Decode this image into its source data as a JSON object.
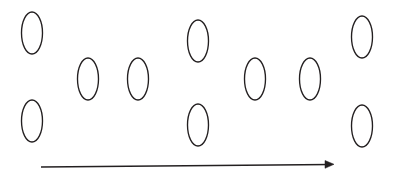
{
  "figure": {
    "background_color": "#ffffff",
    "stroke_color": "#231f20",
    "width": 396,
    "height": 175
  },
  "chart_data": {
    "type": "scatter",
    "title": "",
    "xlabel": "",
    "ylabel": "",
    "grid": false,
    "legend": "none",
    "xlim": [
      0,
      396
    ],
    "ylim": [
      0,
      175
    ],
    "marker": "open-ellipse",
    "note": "Ten open vertically-elongated ellipses in a staggered three-row arrangement above a left-to-right arrow",
    "series": [
      {
        "name": "top-row",
        "points": [
          {
            "x": 32,
            "y": 33
          },
          {
            "x": 198,
            "y": 41
          },
          {
            "x": 362,
            "y": 37
          }
        ]
      },
      {
        "name": "middle-row",
        "points": [
          {
            "x": 88,
            "y": 79
          },
          {
            "x": 138,
            "y": 79
          },
          {
            "x": 255,
            "y": 79
          },
          {
            "x": 310,
            "y": 79
          }
        ]
      },
      {
        "name": "bottom-row",
        "points": [
          {
            "x": 32,
            "y": 121
          },
          {
            "x": 198,
            "y": 125
          },
          {
            "x": 362,
            "y": 126
          }
        ]
      }
    ],
    "ellipse_size": {
      "rx": 10.5,
      "ry": 21
    },
    "annotations": [
      {
        "type": "arrow",
        "label": "",
        "x_start": 41,
        "y_start": 167,
        "x_end": 333,
        "y_end": 164,
        "direction": "left-to-right"
      }
    ]
  },
  "shapes": {
    "ellipses": [
      {
        "id": "ellipse-1",
        "row": "top",
        "cx": 32,
        "cy": 33,
        "rx": 10.5,
        "ry": 21
      },
      {
        "id": "ellipse-2",
        "row": "bottom",
        "cx": 32,
        "cy": 121,
        "rx": 10.5,
        "ry": 21
      },
      {
        "id": "ellipse-3",
        "row": "middle",
        "cx": 88,
        "cy": 79,
        "rx": 10.5,
        "ry": 21
      },
      {
        "id": "ellipse-4",
        "row": "middle",
        "cx": 138,
        "cy": 79,
        "rx": 10.5,
        "ry": 21
      },
      {
        "id": "ellipse-5",
        "row": "top",
        "cx": 198,
        "cy": 41,
        "rx": 10.5,
        "ry": 21
      },
      {
        "id": "ellipse-6",
        "row": "bottom",
        "cx": 198,
        "cy": 125,
        "rx": 10.5,
        "ry": 21
      },
      {
        "id": "ellipse-7",
        "row": "middle",
        "cx": 255,
        "cy": 79,
        "rx": 10.5,
        "ry": 21
      },
      {
        "id": "ellipse-8",
        "row": "middle",
        "cx": 310,
        "cy": 79,
        "rx": 10.5,
        "ry": 21
      },
      {
        "id": "ellipse-9",
        "row": "top",
        "cx": 362,
        "cy": 37,
        "rx": 10.5,
        "ry": 21
      },
      {
        "id": "ellipse-10",
        "row": "bottom",
        "cx": 362,
        "cy": 126,
        "rx": 10.5,
        "ry": 21
      }
    ],
    "arrow": {
      "id": "direction-arrow",
      "x1": 41,
      "y1": 167,
      "x2": 331,
      "y2": 164.5,
      "head_points": "325,160.5 334,164.3 325,168.3"
    }
  }
}
